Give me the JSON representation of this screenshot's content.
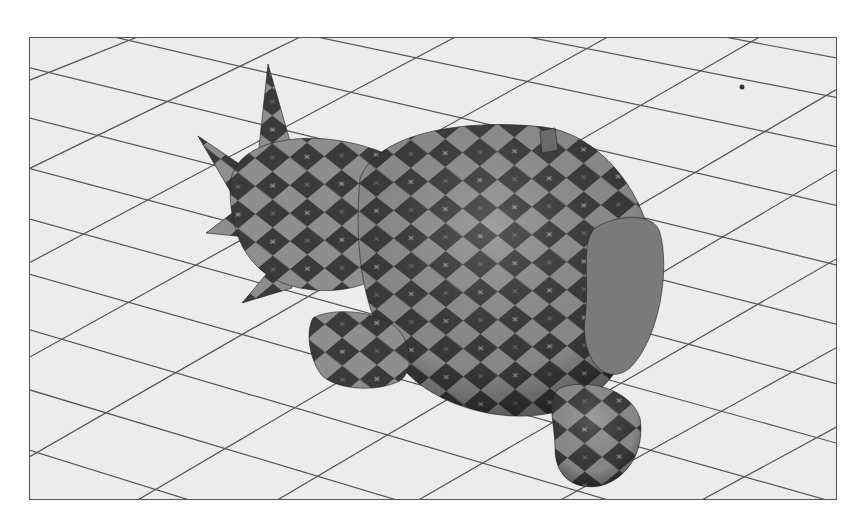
{
  "scene": {
    "description": "3D render of a checker-textured monkey-head model with spikes lying on a perspective grid floor",
    "colors": {
      "floor": "#ececec",
      "grid_line": "#555555",
      "border": "#555555",
      "checker_dark": "#3a3a3a",
      "checker_light": "#8e8e8e",
      "background": "#ffffff"
    },
    "frame": {
      "x": 29,
      "y": 37,
      "width": 808,
      "height": 463
    }
  }
}
